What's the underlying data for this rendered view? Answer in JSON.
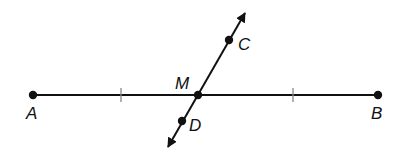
{
  "diagram": {
    "type": "geometry-segment-bisector",
    "colors": {
      "stroke": "#111111",
      "tick": "#888888",
      "background": "#ffffff"
    },
    "segment": {
      "from": "A",
      "to": "B"
    },
    "line": {
      "through": [
        "C",
        "M",
        "D"
      ],
      "arrows": "both"
    },
    "congruence_ticks": 2,
    "points": {
      "A": {
        "label": "A",
        "x": 33,
        "y": 95,
        "lx": 26,
        "ly": 119
      },
      "B": {
        "label": "B",
        "x": 378,
        "y": 95,
        "lx": 371,
        "ly": 119
      },
      "M": {
        "label": "M",
        "x": 198,
        "y": 95,
        "lx": 175,
        "ly": 89
      },
      "C": {
        "label": "C",
        "x": 229,
        "y": 40,
        "lx": 238,
        "ly": 50
      },
      "D": {
        "label": "D",
        "x": 182,
        "y": 121,
        "lx": 189,
        "ly": 131
      }
    }
  }
}
